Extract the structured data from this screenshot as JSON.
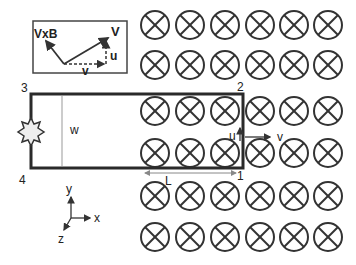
{
  "inset": {
    "labels": {
      "vxb": "VxB",
      "V": "V",
      "u": "u",
      "v": "v"
    }
  },
  "loop": {
    "corners": {
      "c1": "1",
      "c2": "2",
      "c3": "3",
      "c4": "4"
    },
    "width_label": "w",
    "length_label": "L",
    "velocity_labels": {
      "u": "u",
      "v": "v"
    }
  },
  "axes": {
    "x": "x",
    "y": "y",
    "z": "z"
  },
  "field": {
    "symbol": "into-page (⊗)",
    "rows": 6,
    "cols": 6
  }
}
